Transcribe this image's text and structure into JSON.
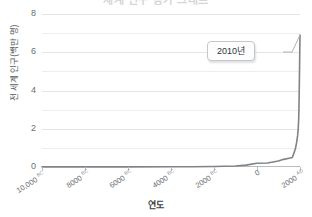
{
  "title": "세계 인구 증가 그래프",
  "axes": {
    "y_title": "전 세계 인구(백만 명)",
    "x_title": "연도"
  },
  "annotation": {
    "label": "2010년"
  },
  "colors": {
    "line": "#808387",
    "grid": "#e2e4e6",
    "grid_minor": "#eceef0",
    "axis": "#b9bcc0",
    "tick_text": "#6a6e73",
    "callout_bg": "#fdfdfd",
    "callout_border": "#c4c7cb",
    "background": "#ffffff"
  },
  "chart_data": {
    "type": "line",
    "title": "세계 인구 증가 그래프",
    "xlabel": "연도",
    "ylabel": "전 세계 인구(백만 명)",
    "xlim": [
      -10000,
      2010
    ],
    "ylim": [
      0,
      8
    ],
    "grid": true,
    "legend": null,
    "y_ticks": [
      0,
      2,
      4,
      6,
      8
    ],
    "y_tick_labels": [
      "0",
      "2",
      "4",
      "6",
      "8"
    ],
    "y_minor_ticks": [
      1,
      3,
      5,
      7
    ],
    "x_ticks": [
      -10000,
      -8000,
      -6000,
      -4000,
      -2000,
      0,
      2000
    ],
    "x_tick_labels": [
      {
        "number": "10,000",
        "era": "BC"
      },
      {
        "number": "8000",
        "era": "BC"
      },
      {
        "number": "6000",
        "era": "BC"
      },
      {
        "number": "4000",
        "era": "BC"
      },
      {
        "number": "2000",
        "era": "BC"
      },
      {
        "number": "0",
        "era": ""
      },
      {
        "number": "2000",
        "era": "AD"
      }
    ],
    "series": [
      {
        "name": "전 세계 인구",
        "x": [
          -10000,
          -8000,
          -6000,
          -4000,
          -3000,
          -2000,
          -1000,
          -500,
          0,
          500,
          1000,
          1250,
          1500,
          1650,
          1750,
          1800,
          1850,
          1900,
          1927,
          1950,
          1960,
          1974,
          1987,
          1999,
          2010
        ],
        "values": [
          0.004,
          0.005,
          0.007,
          0.01,
          0.014,
          0.027,
          0.05,
          0.1,
          0.2,
          0.21,
          0.31,
          0.4,
          0.46,
          0.5,
          0.79,
          0.98,
          1.26,
          1.65,
          2.0,
          2.52,
          3.0,
          4.0,
          5.0,
          6.0,
          6.9
        ]
      }
    ],
    "annotations": [
      {
        "label": "2010년",
        "x": 2010,
        "y": 6.9
      }
    ]
  }
}
